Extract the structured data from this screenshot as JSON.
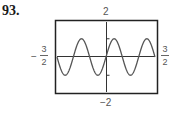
{
  "problem_number": "93.",
  "chart_data": {
    "type": "line",
    "title": "",
    "function": "y = sin(2πx)",
    "xlabel": "",
    "ylabel": "",
    "xlim": [
      -1.5,
      1.5
    ],
    "ylim": [
      -2,
      2
    ],
    "x_tick_labels": {
      "min_sign": "−",
      "min_num": "3",
      "min_den": "2",
      "max_num": "3",
      "max_den": "2"
    },
    "y_tick_labels": {
      "max": "2",
      "min": "−2"
    },
    "y_ticks": [
      -1,
      1
    ],
    "grid": false,
    "series": [
      {
        "name": "curve",
        "amplitude": 1,
        "period": 1,
        "phase": 0
      }
    ]
  }
}
